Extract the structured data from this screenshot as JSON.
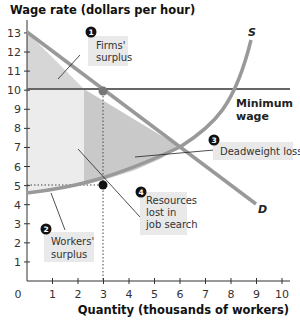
{
  "chart_data": {
    "type": "line",
    "title": "",
    "ylabel": "Wage rate (dollars per hour)",
    "xlabel": "Quantity (thousands of workers)",
    "xlim": [
      0,
      10
    ],
    "ylim": [
      0,
      13
    ],
    "x_ticks": [
      "0",
      "1",
      "2",
      "3",
      "4",
      "5",
      "6",
      "7",
      "8",
      "9",
      "10"
    ],
    "y_ticks": [
      "1",
      "2",
      "3",
      "4",
      "5",
      "6",
      "7",
      "8",
      "9",
      "10",
      "11",
      "12",
      "13"
    ],
    "series": [
      {
        "name": "D",
        "label": "D",
        "points": [
          [
            0,
            13
          ],
          [
            9,
            4
          ]
        ]
      },
      {
        "name": "S",
        "label": "S",
        "points": [
          [
            0,
            4
          ],
          [
            1,
            4.2
          ],
          [
            2,
            4.5
          ],
          [
            3,
            5
          ],
          [
            4,
            5.6
          ],
          [
            5,
            6.2
          ],
          [
            6,
            7
          ],
          [
            7,
            8.2
          ],
          [
            8,
            10
          ],
          [
            8.8,
            12.7
          ]
        ]
      },
      {
        "name": "Minimum wage",
        "label": "Minimum wage",
        "points": [
          [
            0,
            10
          ],
          [
            10.3,
            10
          ]
        ]
      }
    ],
    "points": [
      {
        "x": 3,
        "y": 10,
        "color": "#777777"
      },
      {
        "x": 3,
        "y": 5,
        "color": "#111111"
      }
    ],
    "annotations": [
      {
        "num": "1",
        "text": [
          "Firms'",
          "surplus"
        ]
      },
      {
        "num": "2",
        "text": [
          "Workers'",
          "surplus"
        ]
      },
      {
        "num": "3",
        "text": [
          "Deadweight loss"
        ]
      },
      {
        "num": "4",
        "text": [
          "Resources",
          "lost in",
          "job search"
        ]
      }
    ],
    "labels": {
      "min_wage_line1": "Minimum",
      "min_wage_line2": "wage",
      "supply": "S",
      "demand": "D"
    },
    "grid": false,
    "legend": "none"
  },
  "colors": {
    "curve": "#999999",
    "minwage": "#666666",
    "firms_surplus": "#d4d4d4",
    "workers_surplus": "#ebebeb",
    "deadweight": "#c8c8c8",
    "label_box": "#e9e9e9"
  }
}
